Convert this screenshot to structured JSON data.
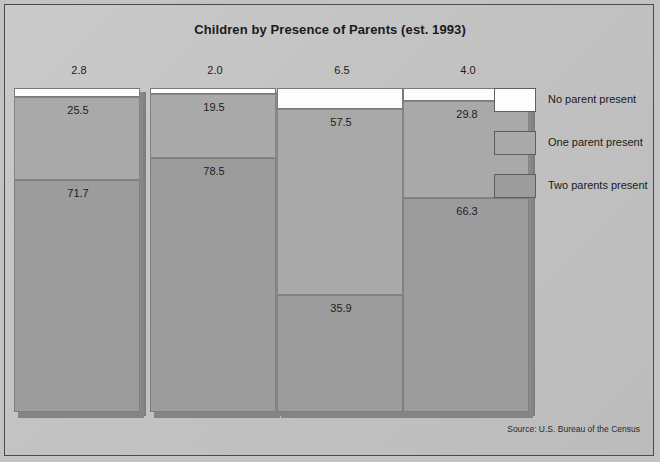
{
  "chart_data": {
    "type": "bar",
    "subtype": "stacked-percent",
    "title": "Children by Presence of Parents (est. 1993)",
    "xlabel": "",
    "ylabel": "",
    "ylim": [
      0,
      100
    ],
    "grid": false,
    "legend_position": "right",
    "categories": [
      "All races",
      "White",
      "Black",
      "Hispanic"
    ],
    "series": [
      {
        "name": "No parent present",
        "color": "#fdfdfd",
        "values": [
          2.8,
          2.0,
          6.5,
          4.0
        ]
      },
      {
        "name": "One parent present",
        "color": "#a9a9a9",
        "values": [
          25.5,
          19.5,
          57.5,
          29.8
        ]
      },
      {
        "name": "Two parents present",
        "color": "#9c9c9c",
        "values": [
          71.7,
          78.5,
          35.9,
          66.3
        ]
      }
    ],
    "annotation": "Source:  U.S. Bureau of the Census"
  },
  "legend": {
    "items": [
      {
        "label": "No parent present"
      },
      {
        "label": "One parent present"
      },
      {
        "label": "Two parents present"
      }
    ]
  },
  "footer": {
    "source": "Source:  U.S. Bureau of the Census"
  }
}
